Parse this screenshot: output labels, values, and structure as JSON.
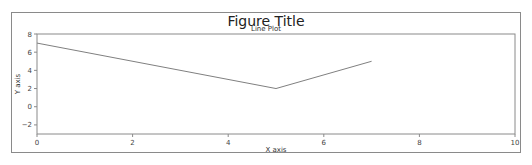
{
  "figure": {
    "title": "Figure Title",
    "subtitle": "Line Plot"
  },
  "chart_data": {
    "type": "line",
    "title": "Line Plot",
    "suptitle": "Figure Title",
    "xlabel": "X axis",
    "ylabel": "Y axis",
    "xlim": [
      0,
      10
    ],
    "ylim": [
      -3,
      8
    ],
    "xticks": [
      0,
      2,
      4,
      6,
      8,
      10
    ],
    "yticks": [
      -2,
      0,
      2,
      4,
      6,
      8
    ],
    "grid": false,
    "legend": null,
    "series": [
      {
        "name": "line",
        "color": "#808080",
        "x": [
          0,
          5,
          7
        ],
        "y": [
          7,
          2,
          5
        ]
      }
    ]
  }
}
